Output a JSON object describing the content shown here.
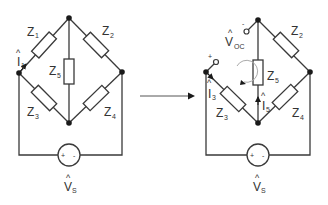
{
  "diagram": {
    "left_circuit": {
      "impedances": [
        {
          "name": "Z",
          "sub": "1"
        },
        {
          "name": "Z",
          "sub": "2"
        },
        {
          "name": "Z",
          "sub": "3"
        },
        {
          "name": "Z",
          "sub": "4"
        },
        {
          "name": "Z",
          "sub": "5"
        }
      ],
      "current": {
        "name": "I",
        "sub": "1",
        "hat": "^"
      },
      "source": {
        "name": "V",
        "sub": "S",
        "hat": "^",
        "plus": "+",
        "minus": "-"
      }
    },
    "arrow": "transform",
    "right_circuit": {
      "impedances": [
        {
          "name": "Z",
          "sub": "2"
        },
        {
          "name": "Z",
          "sub": "3"
        },
        {
          "name": "Z",
          "sub": "4"
        },
        {
          "name": "Z",
          "sub": "5"
        }
      ],
      "currents": [
        {
          "name": "I",
          "sub": "3",
          "hat": "^"
        },
        {
          "name": "I",
          "sub": "5",
          "hat": "^"
        }
      ],
      "open_circuit_voltage": {
        "name": "V",
        "sub": "OC",
        "hat": "^",
        "plus": "+",
        "minus": "-"
      },
      "source": {
        "name": "V",
        "sub": "S",
        "hat": "^",
        "plus": "+",
        "minus": "-"
      }
    },
    "colors": {
      "wire": "#3a3a3a",
      "node": "#1a1a1a",
      "loop": "#aaaaaa"
    }
  }
}
